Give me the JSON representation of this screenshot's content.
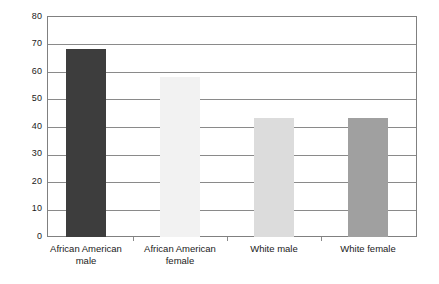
{
  "chart_data": {
    "type": "bar",
    "title": "",
    "subtitle": "",
    "xlabel": "",
    "ylabel": "",
    "categories": [
      "African American male",
      "African American female",
      "White male",
      "White female"
    ],
    "category_lines": [
      [
        "African American",
        "male"
      ],
      [
        "African American",
        "female"
      ],
      [
        "White male"
      ],
      [
        "White female"
      ]
    ],
    "values": [
      68,
      58,
      43,
      43
    ],
    "bar_colors": [
      "#3d3d3d",
      "#f2f2f2",
      "#dcdcdc",
      "#a0a0a0"
    ],
    "ylim": [
      0,
      80
    ],
    "ytick_labels": [
      "0",
      "10",
      "20",
      "30",
      "40",
      "50",
      "60",
      "70",
      "80"
    ],
    "ytick_values": [
      0,
      10,
      20,
      30,
      40,
      50,
      60,
      70,
      80
    ],
    "grid": true,
    "grid_axis": "y",
    "legend": false,
    "legend_position": "none",
    "frame": true,
    "annotations": [],
    "colors": {
      "grid": "#8a8a8a",
      "frame": "#808080",
      "text": "#1a1a1a",
      "background": "#ffffff"
    }
  }
}
